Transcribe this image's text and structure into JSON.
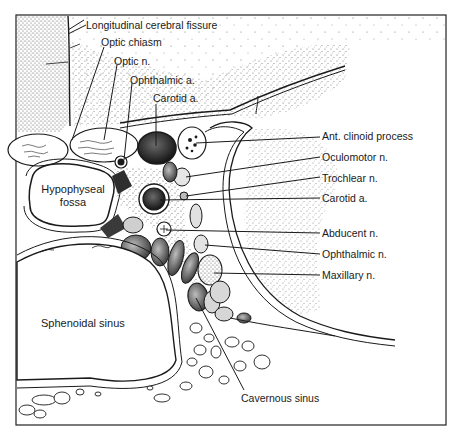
{
  "figure": {
    "frame": {
      "x": 16,
      "y": 15,
      "width": 430,
      "height": 410,
      "stroke": "#222222"
    },
    "colors": {
      "ink": "#1a1a1a",
      "paper": "#ffffff",
      "stipple": "#555555",
      "dark_fill": "#2a2a2a",
      "mid_fill": "#8a8a8a"
    }
  },
  "labels": {
    "left": [
      {
        "id": "longitudinal-cerebral-fissure",
        "text": "Longitudinal cerebral fissure",
        "x": 86,
        "y": 19
      },
      {
        "id": "optic-chiasm",
        "text": "Optic chiasm",
        "x": 101,
        "y": 36
      },
      {
        "id": "optic-n",
        "text": "Optic n.",
        "x": 114,
        "y": 55
      },
      {
        "id": "ophthalmic-a",
        "text": "Ophthalmic a.",
        "x": 130,
        "y": 74
      },
      {
        "id": "carotid-a-top",
        "text": "Carotid a.",
        "x": 153,
        "y": 92
      }
    ],
    "right": [
      {
        "id": "ant-clinoid-process",
        "text": "Ant. clinoid process",
        "x": 322,
        "y": 130
      },
      {
        "id": "oculomotor-n",
        "text": "Oculomotor n.",
        "x": 322,
        "y": 151
      },
      {
        "id": "trochlear-n",
        "text": "Trochlear n.",
        "x": 322,
        "y": 172
      },
      {
        "id": "carotid-a-right",
        "text": "Carotid a.",
        "x": 322,
        "y": 192
      },
      {
        "id": "abducent-n",
        "text": "Abducent n.",
        "x": 322,
        "y": 227
      },
      {
        "id": "ophthalmic-n",
        "text": "Ophthalmic n.",
        "x": 322,
        "y": 248
      },
      {
        "id": "maxillary-n",
        "text": "Maxillary n.",
        "x": 322,
        "y": 269
      }
    ],
    "inner": [
      {
        "id": "hypophyseal-fossa",
        "text_line1": "Hypophyseal",
        "text_line2": "fossa",
        "x": 38,
        "y": 183
      },
      {
        "id": "sphenoidal-sinus",
        "text": "Sphenoidal sinus",
        "x": 41,
        "y": 317
      }
    ],
    "bottom": [
      {
        "id": "cavernous-sinus",
        "text": "Cavernous sinus",
        "x": 241,
        "y": 392
      }
    ]
  }
}
